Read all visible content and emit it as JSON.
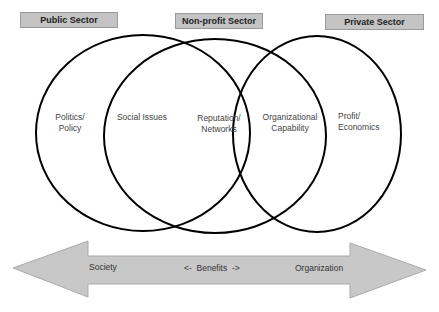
{
  "sectors": [
    {
      "label": "Public Sector"
    },
    {
      "label": "Non-profit Sector"
    },
    {
      "label": "Private Sector"
    }
  ],
  "regions": [
    {
      "line1": "Politics/",
      "line2": "Policy"
    },
    {
      "line1": "Social Issues",
      "line2": ""
    },
    {
      "line1": "Reputation/",
      "line2": "Networks"
    },
    {
      "line1": "Organizational",
      "line2": "Capability"
    },
    {
      "line1": "Profit/",
      "line2": "Economics"
    }
  ],
  "arrow": {
    "left_label": "Society",
    "center_label": "<-  Benefits  ->",
    "right_label": "Organization"
  },
  "colors": {
    "box_fill": "#c4c4c4",
    "arrow_fill": "#c8c8c8",
    "circle_stroke": "#000000"
  }
}
